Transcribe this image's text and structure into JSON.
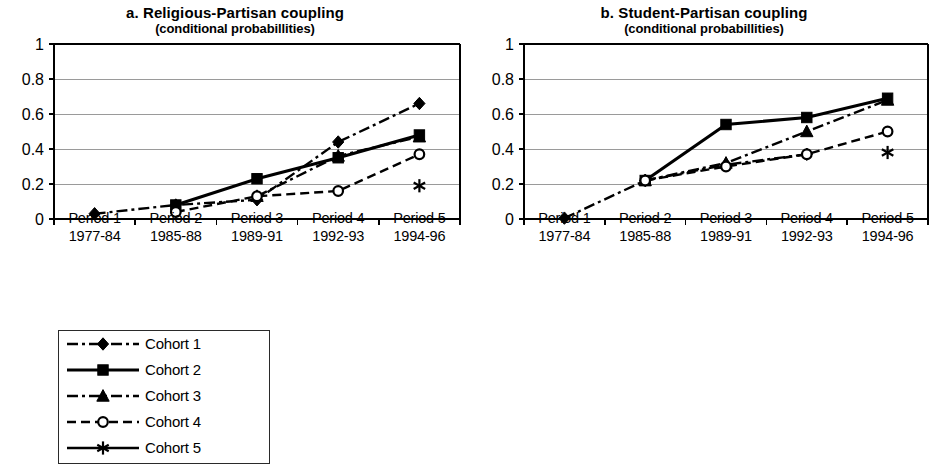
{
  "figure": {
    "background": "#ffffff",
    "ink": "#000000",
    "gridline_color": "#9a9a9a"
  },
  "panels": [
    {
      "id": "panel-a",
      "title": "a. Religious-Partisan coupling",
      "subtitle": "(conditional probabillities)"
    },
    {
      "id": "panel-b",
      "title": "b. Student-Partisan coupling",
      "subtitle": "(conditional probabillities)"
    }
  ],
  "axis": {
    "y_ticks": [
      "0",
      "0.2",
      "0.4",
      "0.6",
      "0.8",
      "1"
    ],
    "x_categories": [
      {
        "period": "Period 1",
        "years": "1977-84"
      },
      {
        "period": "Period 2",
        "years": "1985-88"
      },
      {
        "period": "Period 3",
        "years": "1989-91"
      },
      {
        "period": "Period 4",
        "years": "1992-93"
      },
      {
        "period": "Period 5",
        "years": "1994-96"
      }
    ]
  },
  "legend": {
    "items": [
      {
        "label": "Cohort 1",
        "marker": "diamond",
        "line": "dashdot"
      },
      {
        "label": "Cohort 2",
        "marker": "square",
        "line": "solid"
      },
      {
        "label": "Cohort 3",
        "marker": "triangle",
        "line": "dashdot"
      },
      {
        "label": "Cohort 4",
        "marker": "circle-open",
        "line": "dashed"
      },
      {
        "label": "Cohort 5",
        "marker": "asterisk",
        "line": "solid"
      }
    ]
  },
  "chart_data": [
    {
      "type": "line",
      "title": "a. Religious-Partisan coupling",
      "subtitle": "(conditional probabillities)",
      "xlabel": "",
      "ylabel": "",
      "ylim": [
        0,
        1
      ],
      "ytick_step": 0.2,
      "grid": "horizontal",
      "legend_position": "below-left",
      "categories": [
        "Period 1 1977-84",
        "Period 2 1985-88",
        "Period 3 1989-91",
        "Period 4 1992-93",
        "Period 5 1994-96"
      ],
      "series": [
        {
          "name": "Cohort 1",
          "marker": "diamond",
          "line": "dashdot",
          "values": [
            0.03,
            0.08,
            0.11,
            0.44,
            0.66
          ]
        },
        {
          "name": "Cohort 2",
          "marker": "square",
          "line": "solid",
          "values": [
            null,
            0.08,
            0.23,
            0.35,
            0.48
          ]
        },
        {
          "name": "Cohort 3",
          "marker": "triangle",
          "line": "dashdot",
          "values": [
            null,
            null,
            0.13,
            0.36,
            0.47
          ]
        },
        {
          "name": "Cohort 4",
          "marker": "circle-open",
          "line": "dashed",
          "values": [
            null,
            0.04,
            0.13,
            0.16,
            0.37
          ]
        },
        {
          "name": "Cohort 5",
          "marker": "asterisk",
          "line": "solid",
          "values": [
            null,
            null,
            null,
            null,
            0.19
          ]
        }
      ]
    },
    {
      "type": "line",
      "title": "b. Student-Partisan coupling",
      "subtitle": "(conditional probabillities)",
      "xlabel": "",
      "ylabel": "",
      "ylim": [
        0,
        1
      ],
      "ytick_step": 0.2,
      "grid": "horizontal",
      "legend_position": "below-left",
      "categories": [
        "Period 1 1977-84",
        "Period 2 1985-88",
        "Period 3 1989-91",
        "Period 4 1992-93",
        "Period 5 1994-96"
      ],
      "series": [
        {
          "name": "Cohort 1",
          "marker": "diamond",
          "line": "dashdot",
          "values": [
            0.005,
            0.22,
            0.31,
            0.37,
            null
          ]
        },
        {
          "name": "Cohort 2",
          "marker": "square",
          "line": "solid",
          "values": [
            null,
            0.22,
            0.54,
            0.58,
            0.69
          ]
        },
        {
          "name": "Cohort 3",
          "marker": "triangle",
          "line": "dashdot",
          "values": [
            null,
            0.22,
            0.32,
            0.5,
            0.68
          ]
        },
        {
          "name": "Cohort 4",
          "marker": "circle-open",
          "line": "dashed",
          "values": [
            null,
            0.22,
            0.3,
            0.37,
            0.5
          ]
        },
        {
          "name": "Cohort 5",
          "marker": "asterisk",
          "line": "solid",
          "values": [
            null,
            null,
            null,
            null,
            0.38
          ]
        }
      ]
    }
  ]
}
